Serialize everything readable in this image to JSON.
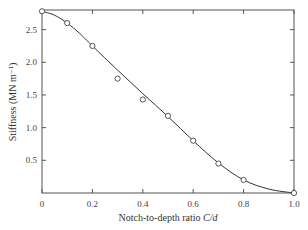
{
  "chart_data": {
    "type": "line",
    "title": "",
    "xlabel": "Notch-to-depth ratio C/d",
    "xlabel_main": "Notch-to-depth ratio ",
    "xlabel_italic": "C/d",
    "ylabel": "Stiffness (MN m⁻¹)",
    "xlim": [
      0,
      1.0
    ],
    "ylim": [
      0,
      2.8
    ],
    "x_ticks": [
      "0",
      "0.2",
      "0.4",
      "0.6",
      "0.8",
      "1.0"
    ],
    "y_ticks": [
      "0.5",
      "1.0",
      "1.5",
      "2.0",
      "2.5"
    ],
    "grid": false,
    "legend": null,
    "series": [
      {
        "name": "Measured",
        "marker": "open-circle",
        "x": [
          0.0,
          0.1,
          0.2,
          0.3,
          0.4,
          0.5,
          0.6,
          0.7,
          0.8,
          1.0
        ],
        "values": [
          2.78,
          2.6,
          2.25,
          1.75,
          1.43,
          1.18,
          0.8,
          0.45,
          0.2,
          0.0
        ]
      },
      {
        "name": "Fitted curve",
        "marker": "none",
        "x": [
          0.0,
          0.05,
          0.1,
          0.15,
          0.2,
          0.3,
          0.4,
          0.5,
          0.6,
          0.7,
          0.8,
          0.9,
          1.0
        ],
        "values": [
          2.78,
          2.72,
          2.6,
          2.44,
          2.25,
          1.88,
          1.52,
          1.17,
          0.8,
          0.46,
          0.2,
          0.06,
          0.0
        ]
      }
    ]
  }
}
